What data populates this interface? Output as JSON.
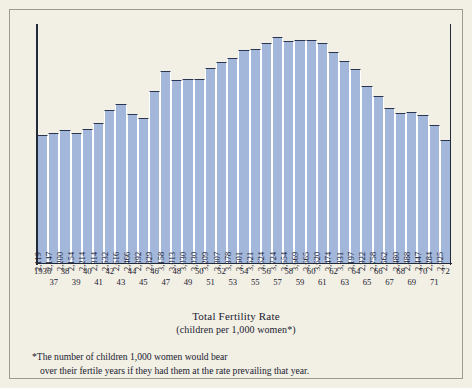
{
  "chart_data": {
    "type": "bar",
    "title": "Total Fertility Rate",
    "subtitle": "(children per 1,000 women*)",
    "xlabel": "",
    "ylabel": "",
    "ylim": [
      0,
      3900
    ],
    "grid": false,
    "legend": null,
    "categories": [
      "1936",
      "37",
      "38",
      "39",
      "40",
      "41",
      "42",
      "43",
      "44",
      "45",
      "46",
      "47",
      "48",
      "49",
      "50",
      "51",
      "52",
      "53",
      "54",
      "55",
      "56",
      "57",
      "58",
      "59",
      "60",
      "61",
      "62",
      "63",
      "64",
      "65",
      "66",
      "67",
      "68",
      "69",
      "70",
      "71",
      "72"
    ],
    "value_labels": [
      "2,119",
      "2,147",
      "2,200",
      "2,154",
      "2,214",
      "2,314",
      "2,532",
      "2,616",
      "2,466",
      "2,392",
      "2,829",
      "3,158",
      "3,013",
      "3,030",
      "3,030",
      "3,209",
      "3,307",
      "3,378",
      "3,501",
      "3,521",
      "3,624",
      "3,724",
      "3,654",
      "3,669",
      "3,665",
      "3,620",
      "3,474",
      "3,331",
      "3,197",
      "2,922",
      "2,758",
      "2,562",
      "2,480",
      "2,488",
      "2,447",
      "2,284",
      "2,025"
    ],
    "values": [
      2119,
      2147,
      2200,
      2154,
      2214,
      2314,
      2532,
      2616,
      2466,
      2392,
      2829,
      3158,
      3013,
      3030,
      3030,
      3209,
      3307,
      3378,
      3501,
      3521,
      3624,
      3724,
      3654,
      3669,
      3665,
      3620,
      3474,
      3331,
      3197,
      2922,
      2758,
      2562,
      2480,
      2488,
      2447,
      2284,
      2025
    ],
    "years_top": [
      "1936",
      "38",
      "40",
      "42",
      "44",
      "46",
      "48",
      "50",
      "52",
      "54",
      "56",
      "58",
      "60",
      "62",
      "64",
      "66",
      "68",
      "70",
      "72"
    ],
    "years_bottom": [
      "37",
      "39",
      "41",
      "43",
      "45",
      "47",
      "49",
      "51",
      "53",
      "55",
      "57",
      "59",
      "61",
      "63",
      "65",
      "67",
      "69",
      "71"
    ],
    "bar_color": "#a3b7db",
    "bar_outline_color": "#2b3550",
    "axis_color": "#222a3a",
    "background_color": "#f2efe4",
    "frame_color": "#9d9a8c"
  },
  "footnote": {
    "line1": "*The number of children 1,000 women would bear",
    "line2": "over their fertile years if they had them at  the rate prevailing that year."
  }
}
